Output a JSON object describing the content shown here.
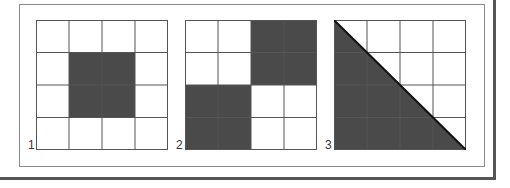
{
  "figures": [
    {
      "label": "1",
      "shaded_cells": [
        [
          1,
          1
        ],
        [
          1,
          2
        ],
        [
          2,
          1
        ],
        [
          2,
          2
        ]
      ],
      "shape": "square"
    },
    {
      "label": "2",
      "shaded_cells": [
        [
          0,
          2
        ],
        [
          0,
          3
        ],
        [
          1,
          2
        ],
        [
          1,
          3
        ],
        [
          2,
          0
        ],
        [
          2,
          1
        ],
        [
          3,
          0
        ],
        [
          3,
          1
        ]
      ],
      "shape": "checker"
    },
    {
      "label": "3",
      "shaded_cells": [],
      "shape": "triangle"
    }
  ],
  "colors": {
    "shade": "#4a4a4a",
    "line": "#555555",
    "frame": "#888888"
  }
}
